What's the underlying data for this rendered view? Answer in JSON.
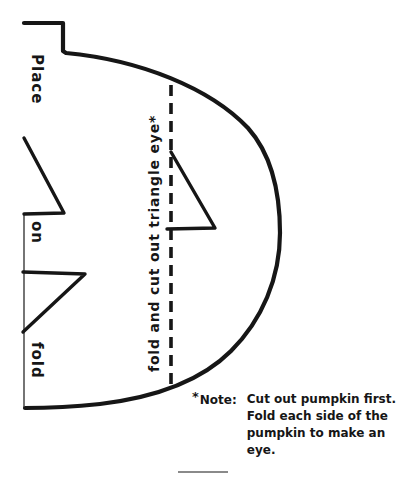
{
  "pattern": {
    "fold_edge_label": {
      "words": [
        "Place",
        "on",
        "fold"
      ]
    },
    "eye_fold_label": "fold and cut out triangle eye*",
    "note": {
      "star": "*",
      "prefix_word": "Note:",
      "lines": [
        "Cut out pumpkin first.",
        "Fold each side of the",
        "pumpkin to make an",
        "eye."
      ]
    },
    "colors": {
      "ink": "#161616",
      "paper": "#ffffff",
      "separator": "#8a8a8a"
    }
  }
}
